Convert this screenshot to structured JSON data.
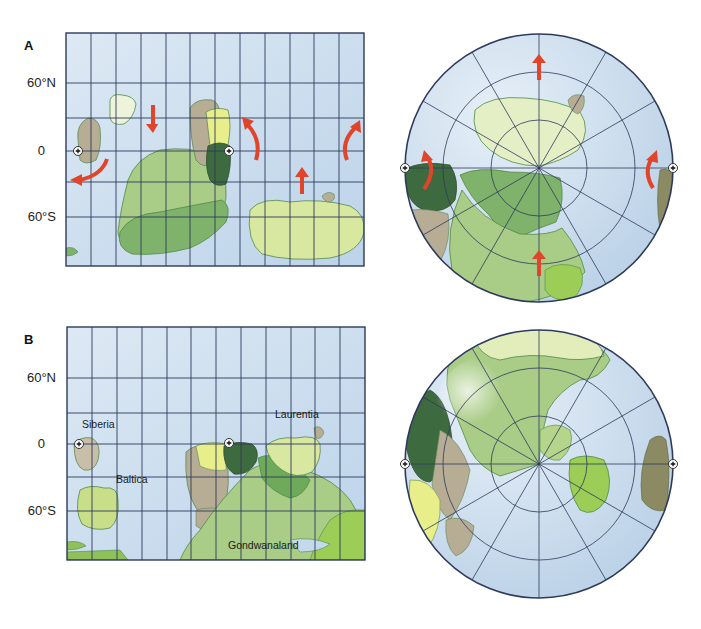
{
  "panels": [
    {
      "letter": "A",
      "map": {
        "lat_labels": {
          "n60": "60°N",
          "eq": "0",
          "s60": "60°S"
        },
        "continent_labels": {}
      }
    },
    {
      "letter": "B",
      "map": {
        "lat_labels": {
          "n60": "60°N",
          "eq": "0",
          "s60": "60°S"
        },
        "continent_labels": {
          "siberia": "Siberia",
          "baltica": "Baltica",
          "laurentia": "Laurentia",
          "gondwanaland": "Gondwanaland"
        }
      }
    }
  ],
  "colors": {
    "ocean": "#c4d9ec",
    "ocean_light": "#dae7f3",
    "grid": "#2e3a5c",
    "arrow": "#e0442a",
    "land_light_green": "#d9e8a0",
    "land_pale": "#eef3dc",
    "land_mid_green": "#a9cc86",
    "land_green": "#7fb36b",
    "land_dark_green": "#3e6a3f",
    "land_tan": "#b7ad95",
    "land_yellow": "#e8ee8a",
    "land_olive": "#8b8a62",
    "land_bright_green": "#9ccd56",
    "coast": "#4f8a4a"
  },
  "icons": [
    "rotation-pole-icon",
    "motion-arrow-icon"
  ]
}
